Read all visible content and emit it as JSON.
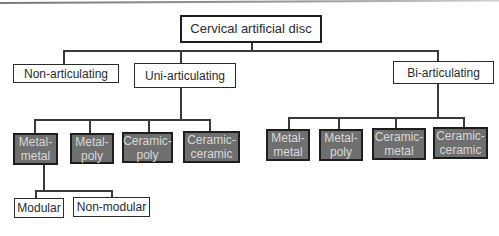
{
  "diagram": {
    "root": {
      "label": "Cervical artificial disc"
    },
    "level1": [
      {
        "label": "Non-articulating"
      },
      {
        "label": "Uni-articulating"
      },
      {
        "label": "Bi-articulating"
      }
    ],
    "uni_children": [
      {
        "line1": "Metal-",
        "line2": "metal"
      },
      {
        "line1": "Metal-",
        "line2": "poly"
      },
      {
        "line1": "Ceramic-",
        "line2": "poly"
      },
      {
        "line1": "Ceramic-",
        "line2": "ceramic"
      }
    ],
    "bi_children": [
      {
        "line1": "Metal-",
        "line2": "metal"
      },
      {
        "line1": "Metal-",
        "line2": "poly"
      },
      {
        "line1": "Ceramic-",
        "line2": "metal"
      },
      {
        "line1": "Ceramic-",
        "line2": "ceramic"
      }
    ],
    "metal_metal_children": [
      {
        "label": "Modular"
      },
      {
        "label": "Non-modular"
      }
    ],
    "colors": {
      "material_box_fill": "#6f6f6f",
      "material_box_text": "#d8d8d8",
      "border": "#1e1e1e",
      "connector": "#3a3a3a"
    }
  }
}
